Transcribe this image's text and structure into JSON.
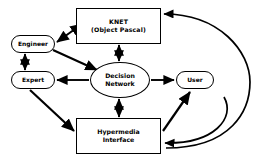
{
  "diagram": {
    "background_color": "#ffffff",
    "stroke_color": "#000000",
    "nodes": [
      {
        "id": "knet",
        "shape": "rectangle",
        "label_line_1": "KNET",
        "label_line_2": "(Object Pascal)"
      },
      {
        "id": "engineer",
        "shape": "rounded-rectangle",
        "label_line_1": "Engineer",
        "label_line_2": ""
      },
      {
        "id": "expert",
        "shape": "rounded-rectangle",
        "label_line_1": "Expert",
        "label_line_2": ""
      },
      {
        "id": "decision-network",
        "shape": "ellipse",
        "label_line_1": "Decision",
        "label_line_2": "Network"
      },
      {
        "id": "user",
        "shape": "rounded-rectangle",
        "label_line_1": "User",
        "label_line_2": ""
      },
      {
        "id": "hypermedia",
        "shape": "rectangle",
        "label_line_1": "Hypermedia",
        "label_line_2": "Interface"
      }
    ],
    "edges": [
      {
        "id": "engineer-knet",
        "from": "engineer",
        "to": "knet",
        "direction": "bidirectional",
        "style": "straight"
      },
      {
        "id": "engineer-expert",
        "from": "engineer",
        "to": "expert",
        "direction": "bidirectional",
        "style": "straight"
      },
      {
        "id": "engineer-decision",
        "from": "engineer",
        "to": "decision-network",
        "direction": "forward",
        "style": "straight"
      },
      {
        "id": "knet-decision",
        "from": "knet",
        "to": "decision-network",
        "direction": "bidirectional",
        "style": "straight"
      },
      {
        "id": "decision-expert",
        "from": "decision-network",
        "to": "expert",
        "direction": "forward",
        "style": "straight"
      },
      {
        "id": "decision-user",
        "from": "decision-network",
        "to": "user",
        "direction": "forward",
        "style": "straight"
      },
      {
        "id": "decision-hypermedia",
        "from": "decision-network",
        "to": "hypermedia",
        "direction": "bidirectional",
        "style": "straight"
      },
      {
        "id": "expert-hypermedia",
        "from": "expert",
        "to": "hypermedia",
        "direction": "forward",
        "style": "straight"
      },
      {
        "id": "hypermedia-user",
        "from": "hypermedia",
        "to": "user",
        "direction": "forward",
        "style": "straight"
      },
      {
        "id": "hypermedia-knet-curve",
        "from": "hypermedia",
        "to": "knet",
        "direction": "forward",
        "style": "curved"
      },
      {
        "id": "user-hypermedia-curve",
        "from": "user",
        "to": "hypermedia",
        "direction": "forward",
        "style": "curved"
      }
    ]
  }
}
